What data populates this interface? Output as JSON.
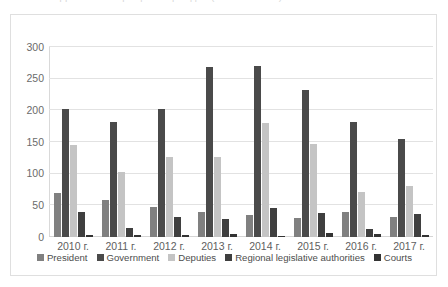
{
  "title_faint": "Динамика обращений граждан (2010–2017 гг.)",
  "axis": {
    "yticks": [
      0,
      50,
      100,
      150,
      200,
      250,
      300
    ],
    "ymin": 0,
    "ymax": 300
  },
  "colors": {
    "president": "#808080",
    "government": "#4a4a4a",
    "deputies": "#c4c4c4",
    "regional": "#3f3f3f",
    "courts": "#333333",
    "gridline": "#e2e2e2",
    "frame": "#dfdfdf",
    "tick_text": "#6b6b6b",
    "legend_text": "#4d4d4d",
    "background": "#ffffff"
  },
  "chart_data": {
    "type": "bar",
    "title": "",
    "xlabel": "",
    "ylabel": "",
    "ylim": [
      0,
      300
    ],
    "grid": true,
    "legend_position": "bottom",
    "categories": [
      "2010 г.",
      "2011 г.",
      "2012 г.",
      "2013 г.",
      "2014 г.",
      "2015 г.",
      "2016 г.",
      "2017 г."
    ],
    "series": [
      {
        "name": "President",
        "color": "#808080",
        "values": [
          69,
          58,
          48,
          40,
          35,
          30,
          40,
          32
        ]
      },
      {
        "name": "Government",
        "color": "#4a4a4a",
        "values": [
          202,
          182,
          202,
          268,
          270,
          232,
          181,
          154
        ]
      },
      {
        "name": "Deputies",
        "color": "#c4c4c4",
        "values": [
          145,
          102,
          126,
          126,
          180,
          147,
          71,
          80
        ]
      },
      {
        "name": "Regional legislative authorities",
        "color": "#3f3f3f",
        "values": [
          39,
          15,
          31,
          28,
          46,
          38,
          12,
          36
        ]
      },
      {
        "name": "Courts",
        "color": "#333333",
        "values": [
          3,
          3,
          3,
          5,
          2,
          7,
          5,
          3
        ]
      }
    ]
  }
}
